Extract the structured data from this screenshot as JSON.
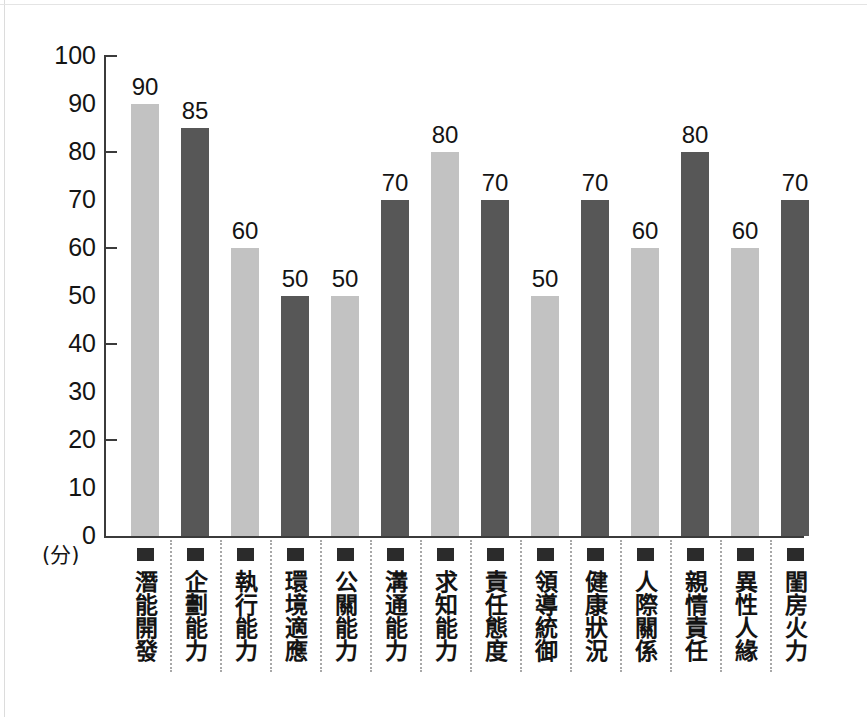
{
  "chart_data": {
    "type": "bar",
    "title": "",
    "xlabel": "",
    "ylabel": "(分)",
    "ylim": [
      0,
      100
    ],
    "ytick_step": 10,
    "major_ticks": [
      0,
      20,
      40,
      60,
      80,
      100
    ],
    "grid": false,
    "legend": "none",
    "categories": [
      "潛能開發",
      "企劃能力",
      "執行能力",
      "環境適應",
      "公關能力",
      "溝通能力",
      "求知能力",
      "責任態度",
      "領導統御",
      "健康狀況",
      "人際關係",
      "親情責任",
      "異性人緣",
      "閨房火力"
    ],
    "values": [
      90,
      85,
      60,
      50,
      50,
      70,
      80,
      70,
      50,
      70,
      60,
      80,
      60,
      70
    ],
    "bar_colors": [
      "light",
      "dark",
      "light",
      "dark",
      "light",
      "dark",
      "light",
      "dark",
      "light",
      "dark",
      "light",
      "dark",
      "light",
      "dark"
    ],
    "value_labels": [
      "90",
      "85",
      "60",
      "50",
      "50",
      "70",
      "80",
      "70",
      "50",
      "70",
      "60",
      "80",
      "60",
      "70"
    ]
  },
  "axis": {
    "y_tick_labels": [
      "100",
      "90",
      "80",
      "70",
      "60",
      "50",
      "40",
      "30",
      "20",
      "10",
      "0"
    ],
    "y_unit": "(分)"
  },
  "colors": {
    "bar_light": "#c2c2c2",
    "bar_dark": "#575757",
    "axis": "#3b3b3b",
    "text": "#141414",
    "divider": "#a8a8a8",
    "background": "#ffffff"
  }
}
